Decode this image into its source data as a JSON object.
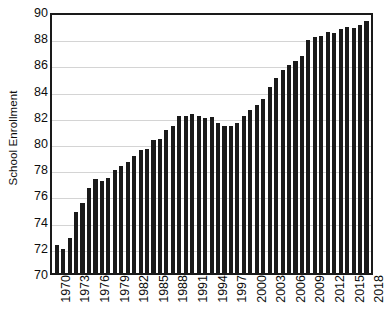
{
  "chart_data": {
    "type": "bar",
    "title": "",
    "subtitle": "",
    "xlabel": "",
    "ylabel": "School Enrollment",
    "ylim": [
      70,
      90
    ],
    "y_ticks": [
      70,
      72,
      74,
      76,
      78,
      80,
      82,
      84,
      86,
      88,
      90
    ],
    "grid": true,
    "legend": null,
    "bar_color": "#1a1a1a",
    "background_color": "#ffffff",
    "axis_color": "#1a1a1a",
    "gridline_color": "#d4d4d4",
    "x_tick_step_years": 3,
    "x_tick_labels": [
      "1970",
      "1973",
      "1976",
      "1979",
      "1982",
      "1985",
      "1988",
      "1991",
      "1994",
      "1997",
      "2000",
      "2003",
      "2006",
      "2009",
      "2012",
      "2015",
      "2018"
    ],
    "categories": [
      "1970",
      "1971",
      "1972",
      "1973",
      "1974",
      "1975",
      "1976",
      "1977",
      "1978",
      "1979",
      "1980",
      "1981",
      "1982",
      "1983",
      "1984",
      "1985",
      "1986",
      "1987",
      "1988",
      "1989",
      "1990",
      "1991",
      "1992",
      "1993",
      "1994",
      "1995",
      "1996",
      "1997",
      "1998",
      "1999",
      "2000",
      "2001",
      "2002",
      "2003",
      "2004",
      "2005",
      "2006",
      "2007",
      "2008",
      "2009",
      "2010",
      "2011",
      "2012",
      "2013",
      "2014",
      "2015",
      "2016",
      "2017",
      "2018"
    ],
    "values": [
      72.2,
      71.9,
      72.7,
      74.7,
      75.4,
      76.6,
      77.3,
      77.1,
      77.4,
      78.0,
      78.3,
      78.6,
      79.1,
      79.5,
      79.6,
      80.3,
      80.4,
      81.1,
      81.4,
      82.2,
      82.2,
      82.3,
      82.2,
      82.0,
      82.1,
      81.6,
      81.4,
      81.4,
      81.6,
      82.2,
      82.6,
      83.0,
      83.5,
      84.4,
      85.1,
      85.7,
      86.1,
      86.4,
      86.8,
      88.1,
      88.3,
      88.4,
      88.7,
      88.6,
      88.9,
      89.1,
      89.0,
      89.2,
      89.5
    ]
  }
}
